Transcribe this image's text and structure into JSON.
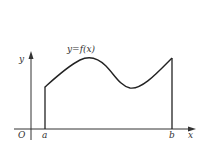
{
  "diagram": {
    "curve_label": "y=f(x)",
    "origin_label": "O",
    "x_axis_label": "x",
    "y_axis_label": "y",
    "left_bound_label": "a",
    "right_bound_label": "b",
    "colors": {
      "stroke": "#222222",
      "text": "#333333",
      "background": "#ffffff"
    }
  }
}
